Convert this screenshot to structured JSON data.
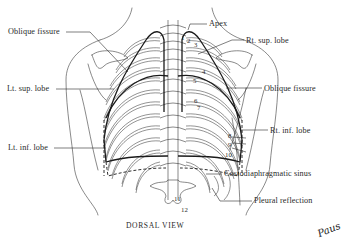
{
  "diagram": {
    "title": "DORSAL VIEW",
    "signature": "Paus",
    "colors": {
      "ink": "#2a2a2a",
      "lung_outline": "#1a1a1a",
      "background": "#ffffff"
    },
    "labels_left": [
      {
        "id": "oblique-fissure-left",
        "text": "Oblique fissure"
      },
      {
        "id": "lt-sup-lobe",
        "text": "Lt. sup. lobe"
      },
      {
        "id": "lt-inf-lobe",
        "text": "Lt. inf. lobe"
      }
    ],
    "labels_right": [
      {
        "id": "apex",
        "text": "Apex"
      },
      {
        "id": "rt-sup-lobe",
        "text": "Rt. sup. lobe"
      },
      {
        "id": "oblique-fissure-right",
        "text": "Oblique fissure"
      },
      {
        "id": "rt-inf-lobe",
        "text": "Rt. inf. lobe"
      },
      {
        "id": "costodiaphragmatic-sinus",
        "text": "Costodiaphragmatic sinus"
      },
      {
        "id": "pleural-reflection",
        "text": "Pleural reflection"
      }
    ],
    "rib_numbers": [
      "1",
      "2",
      "3",
      "4",
      "5",
      "6",
      "7",
      "8",
      "9",
      "10",
      "11",
      "12"
    ]
  }
}
